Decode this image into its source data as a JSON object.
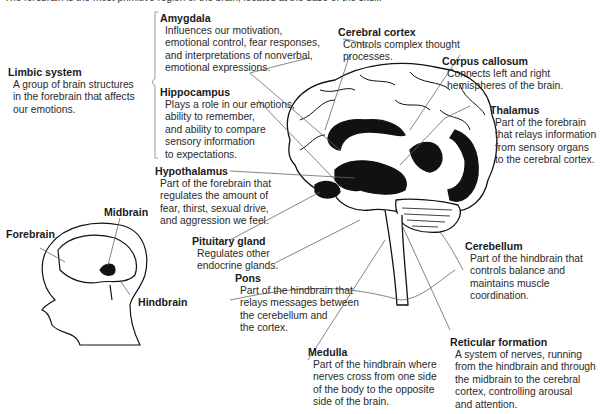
{
  "caption_cutoff": "The forebrain is the most primitive region of the brain, located at the base of the skull.",
  "labels": {
    "limbic": {
      "title": "Limbic system",
      "desc": [
        "A group of brain structures",
        "in the forebrain that affects",
        "our emotions."
      ]
    },
    "amygdala": {
      "title": "Amygdala",
      "desc": [
        "Influences our motivation,",
        "emotional control, fear responses,",
        "and interpretations of nonverbal,",
        "emotional expressions."
      ]
    },
    "hippocampus": {
      "title": "Hippocampus",
      "desc": [
        "Plays a role in our emotions,",
        "ability to remember,",
        "and ability to compare",
        "sensory information",
        "to expectations."
      ]
    },
    "cortex": {
      "title": "Cerebral cortex",
      "desc": [
        "Controls complex thought",
        "processes."
      ]
    },
    "callosum": {
      "title": "Corpus callosum",
      "desc": [
        "Connects left and right",
        "hemispheres of the brain."
      ]
    },
    "thalamus": {
      "title": "Thalamus",
      "desc": [
        "Part of the forebrain",
        "that relays information",
        "from sensory organs",
        "to the cerebral cortex."
      ]
    },
    "hypothalamus": {
      "title": "Hypothalamus",
      "desc": [
        "Part of the forebrain that",
        "regulates the amount of",
        "fear, thirst, sexual drive,",
        "and aggression we feel."
      ]
    },
    "pituitary": {
      "title": "Pituitary gland",
      "desc": [
        "Regulates other",
        "endocrine glands."
      ]
    },
    "pons": {
      "title": "Pons",
      "desc": [
        "Part of the hindbrain that",
        "relays messages between",
        "the cerebellum and",
        "the cortex."
      ]
    },
    "cerebellum": {
      "title": "Cerebellum",
      "desc": [
        "Part of the hindbrain that",
        "controls balance and",
        "maintains muscle",
        "coordination."
      ]
    },
    "medulla": {
      "title": "Medulla",
      "desc": [
        "Part of the hindbrain where",
        "nerves cross from one side",
        "of the body to the opposite",
        "side of the brain."
      ]
    },
    "reticular": {
      "title": "Reticular formation",
      "desc": [
        "A system of nerves, running",
        "from the hindbrain and through",
        "the midbrain to the cerebral",
        "cortex, controlling arousal",
        "and attention."
      ]
    }
  },
  "head_labels": {
    "forebrain": "Forebrain",
    "midbrain": "Midbrain",
    "hindbrain": "Hindbrain"
  }
}
